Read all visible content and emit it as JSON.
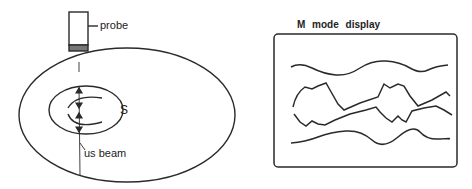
{
  "left_diagram": {
    "probe_label": "probe",
    "structure_label": "S",
    "beam_label": "us beam"
  },
  "right_diagram": {
    "title": "M mode display",
    "trace_count": 4
  },
  "colors": {
    "stroke": "#2a2a2a",
    "background": "#ffffff"
  }
}
